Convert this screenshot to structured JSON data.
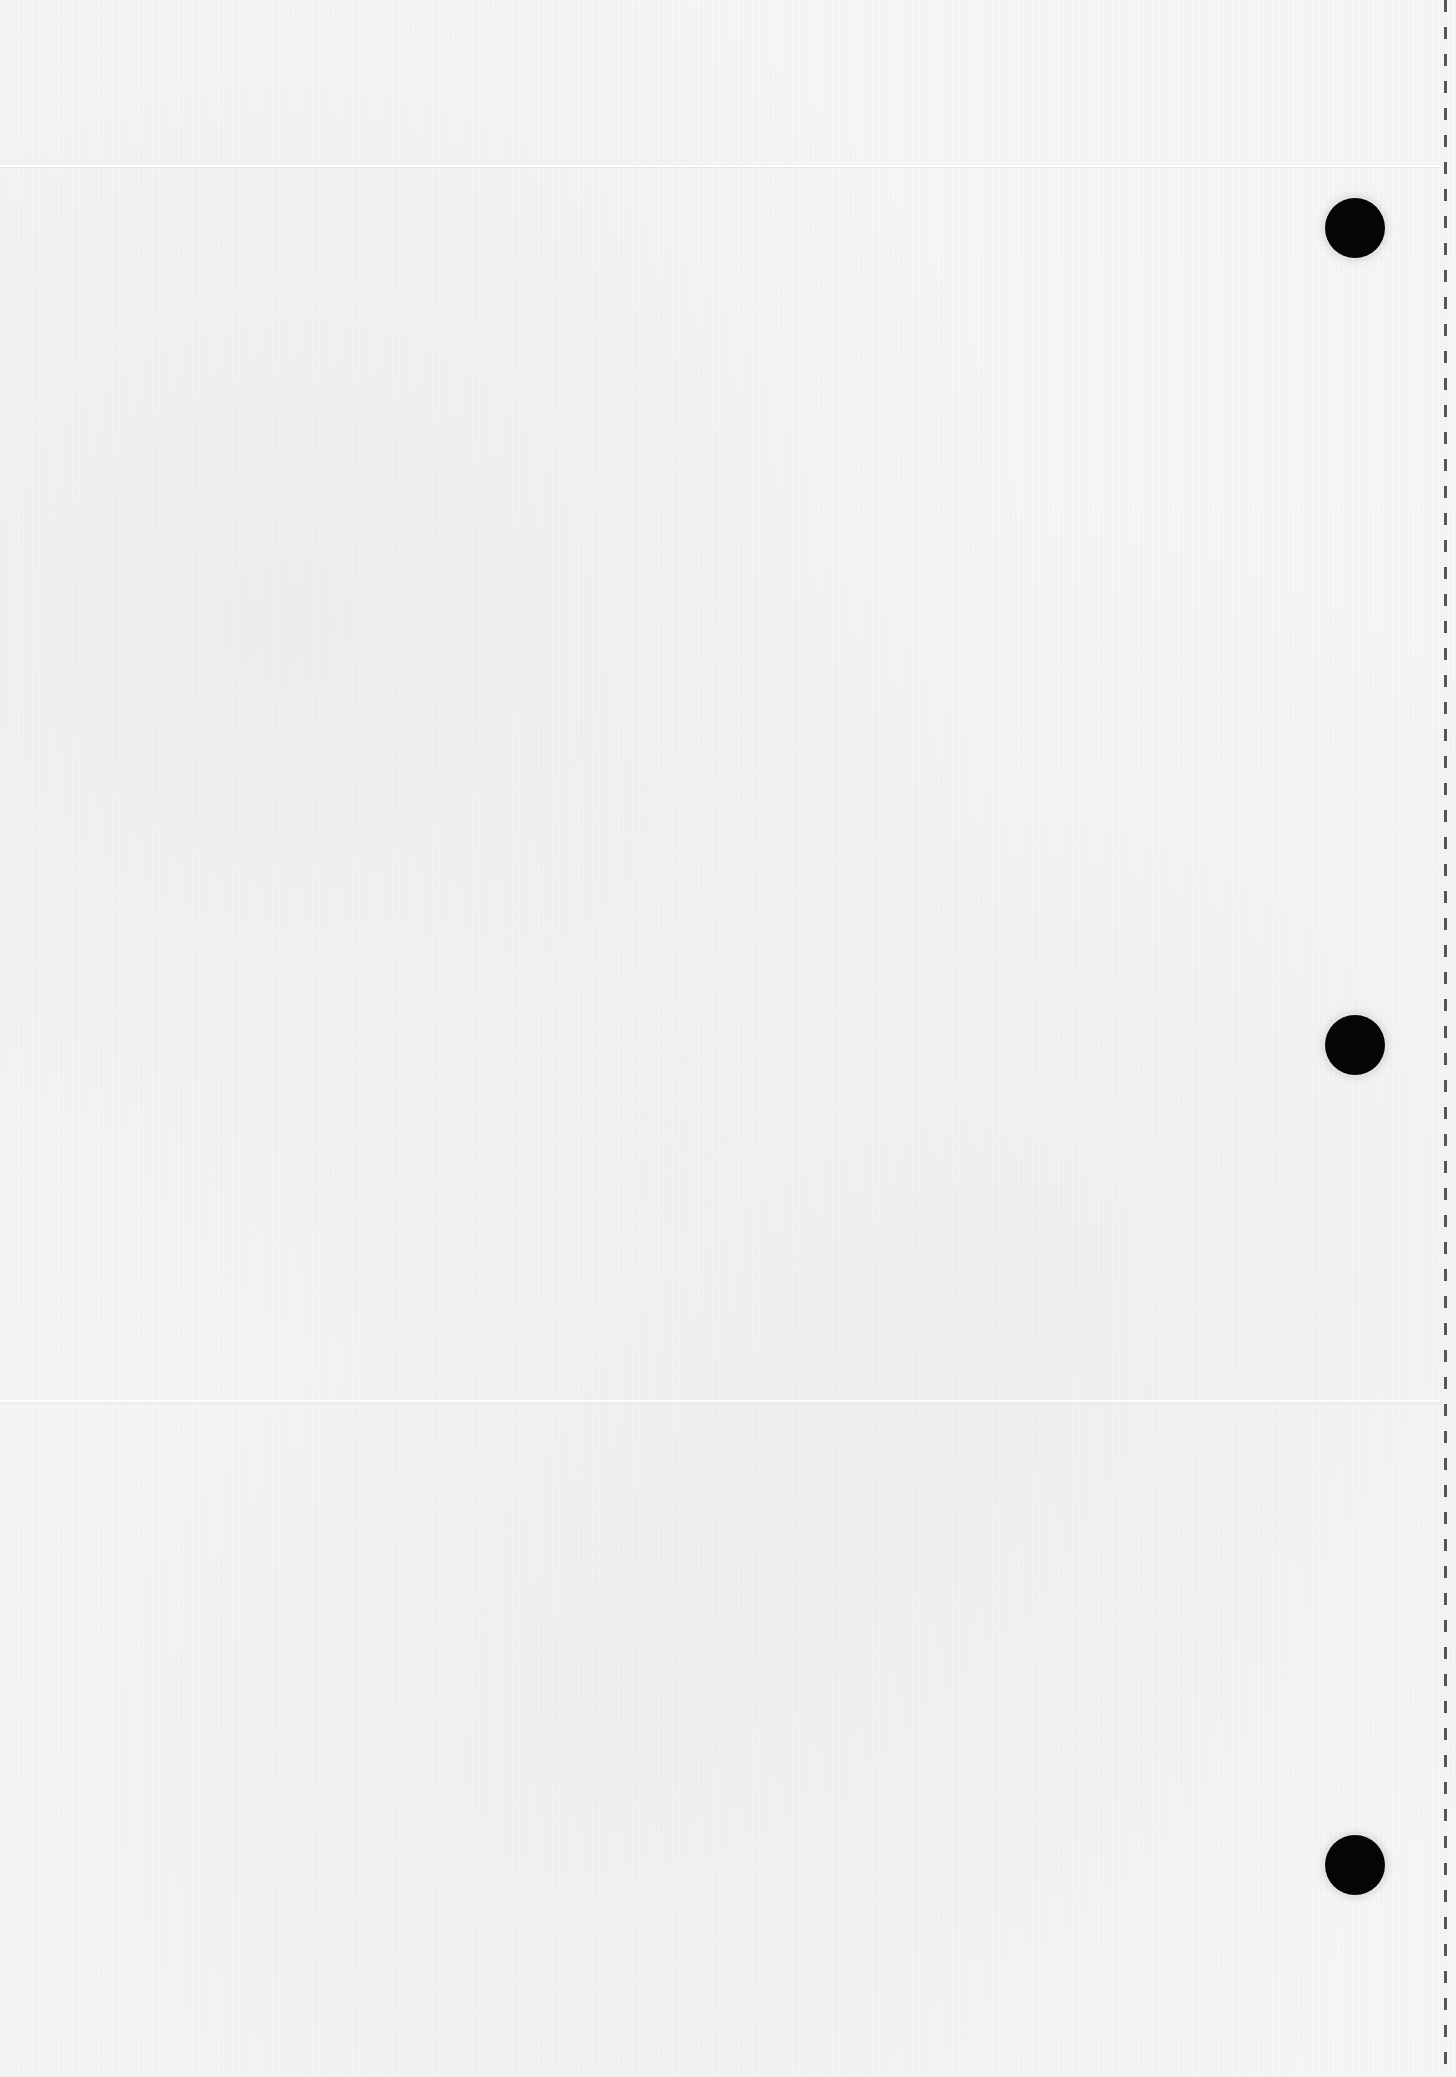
{
  "document": {
    "kind": "blank scanned sheet",
    "text_content": "",
    "paper_color": "#f6f6f6",
    "hole_color": "#050505",
    "perforation_color": "#3a3a3a"
  },
  "layout": {
    "punch_holes": [
      {
        "cx": 1355,
        "cy": 228,
        "r": 30
      },
      {
        "cx": 1355,
        "cy": 1045,
        "r": 30
      },
      {
        "cx": 1355,
        "cy": 1865,
        "r": 30
      }
    ],
    "perforation_x": 1445,
    "fold_lines_y": [
      165,
      1400
    ]
  }
}
